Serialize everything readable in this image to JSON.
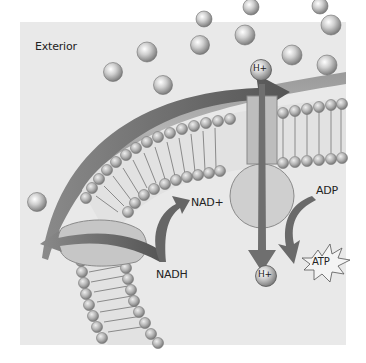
{
  "diagram": {
    "background": "#ececec",
    "labels": {
      "exterior": "Exterior",
      "nad_plus": "NAD+",
      "nadh": "NADH",
      "adp": "ADP",
      "atp": "ATP",
      "h_plus_top": "H+",
      "h_plus_bottom": "H+"
    },
    "colors": {
      "panel": "#e9e9e9",
      "arrow": "#6d6d6d",
      "membrane_band": "#8a8a8a",
      "lipid_head": "#b8b8b8",
      "protein": "#c8c8c8",
      "ion": "#bdbdbd"
    }
  }
}
